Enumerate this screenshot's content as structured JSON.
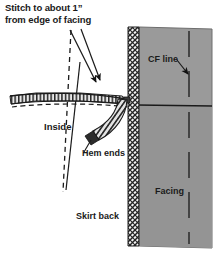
{
  "figure": {
    "name": "sewing-diagram-hem-at-facing",
    "width": 221,
    "height": 253,
    "background": "#ffffff"
  },
  "labels": {
    "title_line1": "Stitch to about 1”",
    "title_line2": "from edge of facing",
    "inside": "Inside",
    "hem_ends": "Hem ends",
    "skirt_back": "Skirt back",
    "cf_line": "CF line",
    "facing": "Facing"
  },
  "colors": {
    "ink": "#1a1a1a",
    "panel_gray": "#9a9a9a",
    "panel_gray_dark": "#8e8e8e",
    "hatch_dark": "#2b2b2b",
    "paper": "#ffffff",
    "hem_fill": "#d8d8d8"
  },
  "elements": {
    "facing_panel": "gray vertical facing panel at right",
    "facing_edge_hatched": "cross-hatched vertical band along left edge of facing",
    "cf_dashed_line": "vertical dashed center-front line inside facing panel",
    "panel_divider": "solid horizontal line across facing panel",
    "hem_band": "horizontal hatched hem band with stitching at left",
    "hem_stitch_dashes": "dashed stitch line along lower edge of hem band",
    "hem_end_curve": "curved hatched hem end sweeping down from facing edge",
    "leader_arrow_1": "leader line with arrowhead from title to hem band",
    "leader_arrow_2": "leader line with arrowhead from title to hem band",
    "leader_arrow_cf": "leader line with arrowhead from CF line label to dashed line",
    "leader_hem_ends": "leader line from Hem ends label to curved hem end",
    "fold_line_dashed": "dashed diagonal fold line of skirt back",
    "fold_line_solid": "solid diagonal seam line of skirt back"
  }
}
